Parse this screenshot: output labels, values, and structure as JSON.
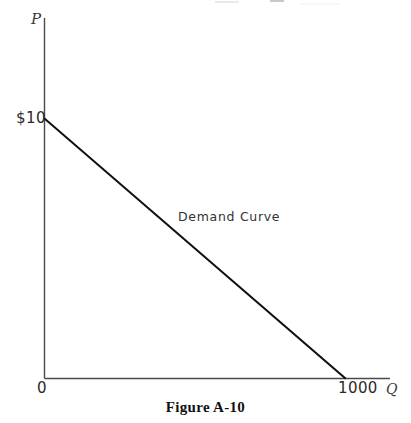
{
  "figure": {
    "caption": "Figure A-10"
  },
  "axes": {
    "y_axis_letter": "P",
    "x_axis_letter": "Q",
    "origin_label": "0",
    "y_tick_label": "$10",
    "x_tick_label": "1000"
  },
  "annotations": {
    "curve_label": "Demand Curve"
  },
  "colors": {
    "background": "#ffffff",
    "axis_line": "#4a4a4a",
    "curve_line": "#111111",
    "text": "#2b2b2b",
    "caption_text": "#111111"
  },
  "chart_data": {
    "type": "line",
    "title": "Figure A-10",
    "xlabel": "Q",
    "ylabel": "P",
    "xlim": [
      0,
      1150
    ],
    "ylim": [
      0,
      13.9
    ],
    "grid": false,
    "legend": null,
    "xticks": [
      0,
      1000
    ],
    "xticklabels": [
      "0",
      "1000"
    ],
    "yticks": [
      10
    ],
    "yticklabels": [
      "$10"
    ],
    "series": [
      {
        "name": "Demand Curve",
        "x": [
          0,
          1000
        ],
        "y": [
          10,
          0
        ],
        "style": "solid",
        "annotation": "Demand Curve",
        "annotation_x": 430,
        "annotation_y": 6.2
      }
    ]
  }
}
